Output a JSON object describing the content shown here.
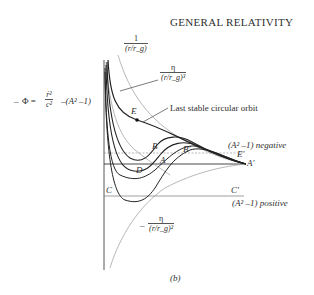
{
  "figure": {
    "title": "GENERAL RELATIVITY",
    "caption": "(b)",
    "equation": {
      "lhs": "Φ =",
      "prefix": "–",
      "numerator": "ṙ²",
      "denominator": "c²",
      "rhs": "–(A² –1)"
    },
    "curve_labels": {
      "newtonian_potential": {
        "numerator": "1",
        "denominator": "(r/r_g)"
      },
      "cubic_term": {
        "numerator": "η",
        "denominator": "(r/r_g)³"
      },
      "quadratic_term": {
        "prefix": "–",
        "numerator": "η",
        "denominator": "(r/r_g)²"
      }
    },
    "annotations": {
      "last_stable": "Last stable circular orbit",
      "negative": "(A² –1) negative",
      "positive": "(A² –1) positive"
    },
    "points": {
      "E": "E",
      "B": "B",
      "B_prime": "B′",
      "A": "A",
      "A_prime": "A′",
      "D": "D",
      "C": "C",
      "C_prime": "C′",
      "E_prime": "E′"
    },
    "colors": {
      "ink": "#2a2a2a",
      "faint": "#9a9a9a",
      "background": "#ffffff"
    }
  }
}
